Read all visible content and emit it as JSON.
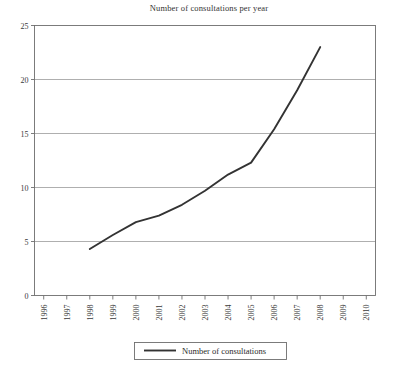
{
  "chart_data": {
    "type": "line",
    "title": "Number of consultations per year",
    "xlabel": "",
    "ylabel": "",
    "x": [
      1996,
      1997,
      1998,
      1999,
      2000,
      2001,
      2002,
      2003,
      2004,
      2005,
      2006,
      2007,
      2008,
      2009,
      2010
    ],
    "xtick_labels": [
      "1996",
      "1997",
      "1998",
      "1999",
      "2000",
      "2001",
      "2002",
      "2003",
      "2004",
      "2005",
      "2006",
      "2007",
      "2008",
      "2009",
      "2010"
    ],
    "xlim": [
      1995.6,
      2010.4
    ],
    "ylim": [
      0,
      25
    ],
    "ytick_labels": [
      "0",
      "5",
      "10",
      "15",
      "20",
      "25"
    ],
    "yticks": [
      0,
      5,
      10,
      15,
      20,
      25
    ],
    "grid": "horizontal",
    "legend_position": "bottom-center",
    "series": [
      {
        "name": "Number of consultations",
        "color": "#333333",
        "x": [
          1998,
          1999,
          2000,
          2001,
          2002,
          2003,
          2004,
          2005,
          2006,
          2007,
          2008
        ],
        "values": [
          4.3,
          5.6,
          6.8,
          7.4,
          8.4,
          9.7,
          11.2,
          12.3,
          15.4,
          19.0,
          23.0
        ]
      }
    ]
  },
  "legend": {
    "entries": [
      {
        "label": "Number of consultations"
      }
    ]
  }
}
